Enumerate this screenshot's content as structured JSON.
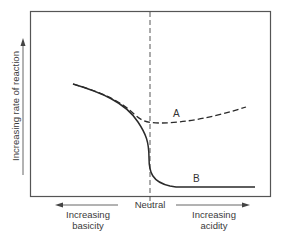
{
  "diagram": {
    "type": "reaction-rate-vs-pH schematic",
    "y_axis_label": "Increasing rate of reaction",
    "x_center_label": "Neutral",
    "x_left_label_line1": "Increasing",
    "x_left_label_line2": "basicity",
    "x_right_label_line1": "Increasing",
    "x_right_label_line2": "acidity",
    "curves": [
      {
        "name": "A",
        "style": "dashed",
        "description": "rate decreases toward neutral, then rises slightly in acid"
      },
      {
        "name": "B",
        "style": "solid",
        "description": "rate decreases sharply near neutral and stays low in acid"
      }
    ],
    "colors": {
      "line": "#2a2a2a",
      "frame": "#555555",
      "text": "#3a3a3a"
    }
  }
}
